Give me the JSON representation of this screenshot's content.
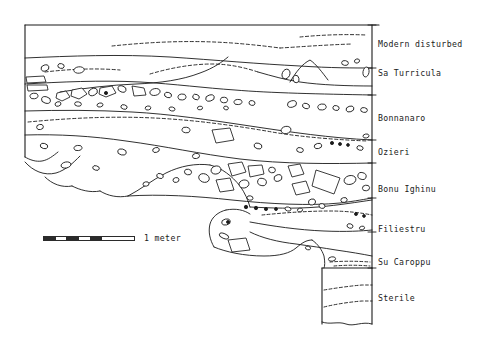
{
  "figure": {
    "type": "archaeological-stratigraphic-section",
    "background_color": "#ffffff",
    "ink_color": "#1a1a1a"
  },
  "scale": {
    "label": "1 meter",
    "bar_segments": [
      "on",
      "off",
      "on",
      "off",
      "on",
      "off-wide"
    ],
    "units": "meter",
    "length_value": 1
  },
  "layers": [
    {
      "id": "modern-disturbed",
      "label": "Modern disturbed",
      "label_x": 378,
      "label_y": 43
    },
    {
      "id": "sa-turricula",
      "label": "Sa Turricula",
      "label_x": 378,
      "label_y": 72
    },
    {
      "id": "bonnanaro",
      "label": "Bonnanaro",
      "label_x": 378,
      "label_y": 117
    },
    {
      "id": "ozieri",
      "label": "Ozieri",
      "label_x": 378,
      "label_y": 151
    },
    {
      "id": "bonu-ighinu",
      "label": "Bonu Ighinu",
      "label_x": 378,
      "label_y": 188
    },
    {
      "id": "filiestru",
      "label": "Filiestru",
      "label_x": 378,
      "label_y": 228
    },
    {
      "id": "su-caroppu",
      "label": "Su Caroppu",
      "label_x": 378,
      "label_y": 261
    },
    {
      "id": "sterile",
      "label": "Sterile",
      "label_x": 378,
      "label_y": 297
    }
  ]
}
